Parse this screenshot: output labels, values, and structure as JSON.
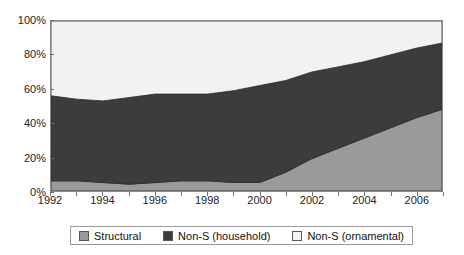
{
  "chart_data": {
    "type": "area",
    "stacked": true,
    "normalized": true,
    "title": "",
    "xlabel": "",
    "ylabel": "",
    "xlim": [
      1992,
      2007
    ],
    "ylim": [
      0,
      100
    ],
    "grid": false,
    "legend_position": "bottom",
    "x": [
      1992,
      1993,
      1994,
      1995,
      1996,
      1997,
      1998,
      1999,
      2000,
      2001,
      2002,
      2003,
      2004,
      2005,
      2006,
      2007
    ],
    "x_tick_labels": [
      "1992",
      "1994",
      "1996",
      "1998",
      "2000",
      "2002",
      "2004",
      "2006"
    ],
    "y_tick_labels": [
      "0%",
      "20%",
      "40%",
      "60%",
      "80%",
      "100%"
    ],
    "y_ticks": [
      0,
      20,
      40,
      60,
      80,
      100
    ],
    "series": [
      {
        "name": "Structural",
        "color": "#9a9a9a",
        "values": [
          6,
          6,
          5,
          4,
          5,
          6,
          6,
          5,
          5,
          11,
          19,
          25,
          31,
          37,
          43,
          48
        ]
      },
      {
        "name": "Non-S (household)",
        "color": "#3c3c3c",
        "values": [
          50,
          48,
          48,
          51,
          52,
          51,
          51,
          54,
          57,
          54,
          51,
          48,
          45,
          43,
          41,
          39
        ]
      },
      {
        "name": "Non-S (ornamental)",
        "color": "#f2f2f2",
        "values": [
          44,
          46,
          47,
          45,
          43,
          43,
          43,
          41,
          38,
          35,
          30,
          27,
          24,
          20,
          16,
          13
        ]
      }
    ],
    "cumulative_upper_bounds": {
      "structural": [
        6,
        6,
        5,
        4,
        5,
        6,
        6,
        5,
        5,
        11,
        19,
        25,
        31,
        37,
        43,
        48
      ],
      "structural_plus_household": [
        56,
        54,
        53,
        55,
        57,
        57,
        57,
        59,
        62,
        65,
        70,
        73,
        76,
        80,
        84,
        87
      ]
    }
  },
  "legend": {
    "items": [
      {
        "label": "Structural",
        "swatch": "#9a9a9a"
      },
      {
        "label": "Non-S (household)",
        "swatch": "#3c3c3c"
      },
      {
        "label": "Non-S (ornamental)",
        "swatch": "#f4f4f4"
      }
    ]
  }
}
